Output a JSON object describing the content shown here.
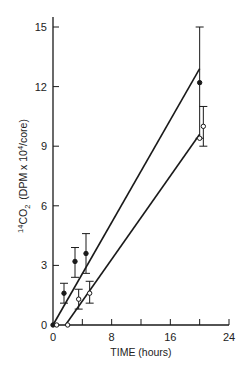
{
  "chart_data": {
    "type": "scatter",
    "title": "",
    "xlabel": "TIME  (hours)",
    "ylabel_main": "CO",
    "ylabel_sup": "14",
    "ylabel_sub": "2",
    "ylabel_units_pre": "(DPM x 10",
    "ylabel_units_sup": "4",
    "ylabel_units_post": "/core)",
    "xlim": [
      0,
      24
    ],
    "ylim": [
      0,
      15
    ],
    "x_ticks_labeled": [
      0,
      8,
      16,
      24
    ],
    "x_ticks_minor": [
      4,
      12,
      20
    ],
    "y_ticks": [
      0,
      3,
      6,
      9,
      12,
      15
    ],
    "grid": false,
    "legend": false,
    "series": [
      {
        "name": "filled-circles",
        "marker": "filled",
        "points": [
          {
            "x": 0,
            "y": 0,
            "err_low": 0,
            "err_high": 0
          },
          {
            "x": 1.5,
            "y": 1.6,
            "err_low": 1.1,
            "err_high": 2.1
          },
          {
            "x": 3,
            "y": 3.2,
            "err_low": 2.4,
            "err_high": 3.9
          },
          {
            "x": 4.5,
            "y": 3.6,
            "err_low": 2.6,
            "err_high": 4.6
          },
          {
            "x": 20,
            "y": 12.2,
            "err_low": 9.4,
            "err_high": 15.0
          }
        ],
        "fit_line": {
          "x0": 0,
          "y0": 0,
          "x1": 20,
          "y1": 12.9
        }
      },
      {
        "name": "open-circles",
        "marker": "open",
        "points": [
          {
            "x": 0.5,
            "y": 0,
            "err_low": 0,
            "err_high": 0
          },
          {
            "x": 2,
            "y": 0,
            "err_low": 0,
            "err_high": 0
          },
          {
            "x": 3.5,
            "y": 1.3,
            "err_low": 0.8,
            "err_high": 1.8
          },
          {
            "x": 5,
            "y": 1.6,
            "err_low": 1.1,
            "err_high": 2.2
          },
          {
            "x": 20,
            "y": 9.4,
            "err_low": 9.4,
            "err_high": 9.4
          },
          {
            "x": 20.5,
            "y": 10.0,
            "err_low": 9.0,
            "err_high": 11.0
          }
        ],
        "fit_line": {
          "x0": 1.7,
          "y0": 0,
          "x1": 20,
          "y1": 9.6
        }
      }
    ]
  }
}
